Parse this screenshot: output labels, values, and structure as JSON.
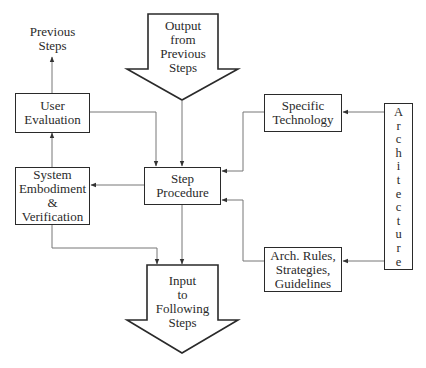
{
  "diagram": {
    "labels": {
      "previous_steps": "Previous\nSteps",
      "output_from_previous": "Output\nfrom\nPrevious\nSteps",
      "user_evaluation": "User\nEvaluation",
      "system_embodiment": "System\nEmbodiment\n&\nVerification",
      "step_procedure": "Step\nProcedure",
      "specific_technology": "Specific\nTechnology",
      "arch_rules": "Arch. Rules,\nStrategies,\nGuidelines",
      "input_to_following": "Input\nto\nFollowing\nSteps",
      "architecture": "Architecture"
    },
    "architecture_letters": [
      "A",
      "r",
      "c",
      "h",
      "i",
      "t",
      "e",
      "c",
      "t",
      "u",
      "r",
      "e"
    ],
    "colors": {
      "stroke": "#2a2a2a",
      "connector": "#777777",
      "background": "#ffffff"
    }
  }
}
